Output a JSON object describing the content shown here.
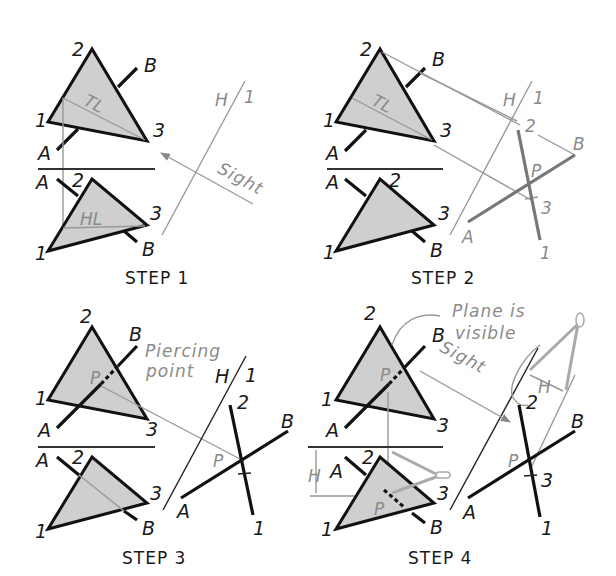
{
  "figure": {
    "type": "descriptive geometry construction"
  },
  "colors": {
    "line": "#111111",
    "construction": "#999999",
    "plane_fill": "#cfcfcf"
  },
  "panels": [
    {
      "step_label": "STEP 1",
      "vertex_labels": {
        "top_2": "2",
        "top_1": "1",
        "top_3": "3",
        "top_A": "A",
        "top_B": "B",
        "bot_2": "2",
        "bot_1": "1",
        "bot_3": "3",
        "bot_A": "A",
        "bot_B": "B"
      },
      "true_length_label": "TL",
      "horizontal_line_label": "HL",
      "fold_H": "H",
      "fold_1": "1",
      "sight_label": "Sight"
    },
    {
      "step_label": "STEP 2",
      "vertex_labels": {
        "top_2": "2",
        "top_1": "1",
        "top_3": "3",
        "top_A": "A",
        "top_B": "B",
        "bot_2": "2",
        "bot_1": "1",
        "bot_3": "3",
        "bot_A": "A",
        "bot_B": "B"
      },
      "true_length_label": "TL",
      "fold_H": "H",
      "fold_1": "1",
      "aux_labels": {
        "p2": "2",
        "pB": "B",
        "pP": "P",
        "p3": "3",
        "pA": "A",
        "p1": "1"
      }
    },
    {
      "step_label": "STEP 3",
      "vertex_labels": {
        "top_2": "2",
        "top_1": "1",
        "top_3": "3",
        "top_A": "A",
        "top_B": "B",
        "bot_2": "2",
        "bot_1": "1",
        "bot_3": "3",
        "bot_A": "A",
        "bot_B": "B"
      },
      "piercing_note_line1": "Piercing",
      "piercing_note_line2": "point",
      "point_P_top": "P",
      "fold_H": "H",
      "fold_1": "1",
      "aux_labels": {
        "p2": "2",
        "pB": "B",
        "pP": "P",
        "pA": "A",
        "p1": "1"
      }
    },
    {
      "step_label": "STEP 4",
      "vertex_labels": {
        "top_2": "2",
        "top_1": "1",
        "top_3": "3",
        "top_A": "A",
        "top_B": "B",
        "bot_2": "2",
        "bot_1": "1",
        "bot_3": "3",
        "bot_A": "A",
        "bot_B": "B"
      },
      "visible_note_line1": "Plane is",
      "visible_note_line2": "visible",
      "sight_label": "Sight",
      "dim_H_top": "H",
      "dim_H_left": "H",
      "point_P_top": "P",
      "point_P_bottom": "P",
      "aux_labels": {
        "p2": "2",
        "pB": "B",
        "pP": "P",
        "p3": "3",
        "pA": "A",
        "p1": "1"
      }
    }
  ]
}
